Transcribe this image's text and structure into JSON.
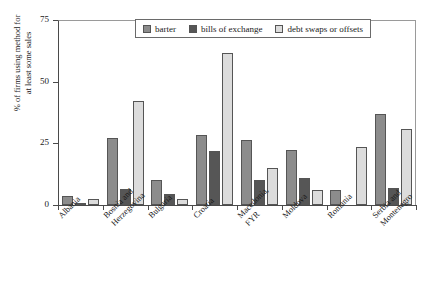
{
  "chart_data": {
    "type": "bar",
    "title": "",
    "xlabel": "",
    "ylabel": "% of firms using method for\nat least some sales",
    "ylim": [
      0,
      75
    ],
    "yticks": [
      0,
      25,
      50,
      75
    ],
    "ytick_labels": [
      "0",
      "25",
      "50",
      "75"
    ],
    "grid": false,
    "legend_position": "top-center",
    "categories": [
      "Albania",
      "Bosnia and\nHerzegovina",
      "Bulgaria",
      "Croatia",
      "Macedonia,\nFYR",
      "Moldova",
      "Romania",
      "Serbia and\nMontenegro"
    ],
    "series": [
      {
        "name": "barter",
        "color": "#8c8c8c",
        "values": [
          3.5,
          27,
          10,
          28.5,
          26.5,
          22.5,
          6,
          37
        ]
      },
      {
        "name": "bills of exchange",
        "color": "#565656",
        "values": [
          1,
          6.5,
          4.5,
          22,
          10,
          11,
          0,
          7
        ]
      },
      {
        "name": "debt swaps or offsets",
        "color": "#dcdcdc",
        "values": [
          2.5,
          42,
          2.5,
          61.5,
          15,
          6,
          23.5,
          31
        ]
      }
    ]
  },
  "legend": {
    "entries": [
      {
        "label": "barter"
      },
      {
        "label": "bills of exchange"
      },
      {
        "label": "debt swaps or offsets"
      }
    ]
  }
}
